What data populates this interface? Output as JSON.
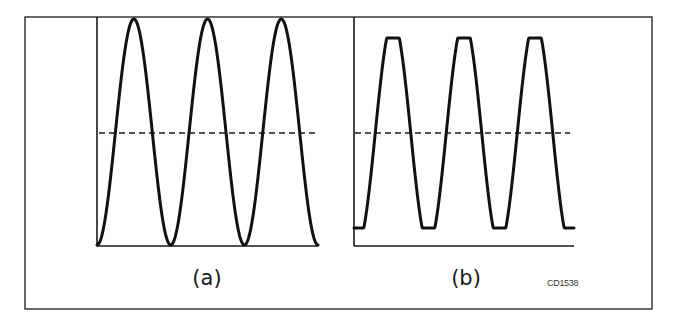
{
  "figure": {
    "code": "CD1538",
    "panels": [
      {
        "id": "a",
        "label": "(a)",
        "description": "Full sinusoidal waveform, three complete cycles, with dashed midline",
        "waveform": "sine"
      },
      {
        "id": "b",
        "label": "(b)",
        "description": "Clipped waveform with flattened peaks and troughs, three cycles, with dashed midline",
        "waveform": "clipped-sine"
      }
    ],
    "colors": {
      "line": "#111111",
      "background": "#ffffff"
    }
  }
}
